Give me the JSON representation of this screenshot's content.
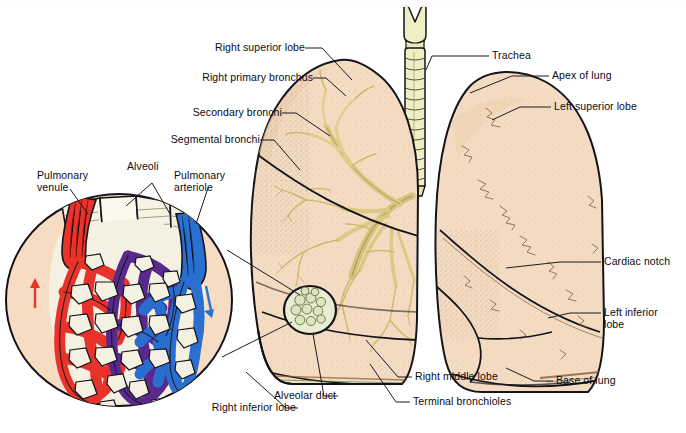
{
  "figure": {
    "type": "anatomical-diagram"
  },
  "palette": {
    "lung_tissue": "#f2d5bb",
    "lung_tissue_light": "#f7e2cd",
    "bronchi_yellow": "#efe3a8",
    "bronchi_yellow_dark": "#d8c477",
    "trachea": "#f0efc4",
    "outline": "#14131a",
    "vein_red": "#e8342c",
    "artery_blue": "#2b6fd0",
    "capillary_purple": "#5b2a8c",
    "alveoli_white": "#f4f1e2",
    "inset_bg": "#f7dcc4",
    "label_text": "#0b0b12",
    "leader_line": "#1b1a22"
  },
  "labels": {
    "right_superior_lobe": "Right superior lobe",
    "right_primary_bronchus": "Right primary bronchus",
    "secondary_bronchi": "Secondary bronchi",
    "segmental_bronchi": "Segmental bronchi",
    "trachea": "Trachea",
    "apex_of_lung": "Apex of lung",
    "left_superior_lobe": "Left superior lobe",
    "cardiac_notch": "Cardiac notch",
    "left_inferior_lobe_l1": "Left inferior",
    "left_inferior_lobe_l2": "lobe",
    "base_of_lung": "Base of lung",
    "right_middle_lobe": "Right middle lobe",
    "terminal_bronchioles": "Terminal bronchioles",
    "alveolar_duct": "Alveolar duct",
    "right_inferior_lobe": "Right inferior lobe",
    "pulmonary_venule_l1": "Pulmonary",
    "pulmonary_venule_l2": "venule",
    "alveoli": "Alveoli",
    "pulmonary_arteriole_l1": "Pulmonary",
    "pulmonary_arteriole_l2": "arteriole"
  },
  "icons": {
    "blood_flow_up": "red-up-arrow-icon",
    "blood_flow_down": "blue-down-arrow-icon"
  }
}
